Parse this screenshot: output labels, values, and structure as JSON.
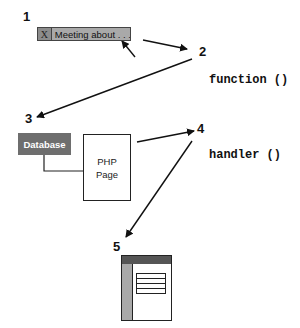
{
  "steps": [
    {
      "number": "1",
      "label": "step-1"
    },
    {
      "number": "2",
      "label": "step-2"
    },
    {
      "number": "3",
      "label": "step-3"
    },
    {
      "number": "4",
      "label": "step-4"
    },
    {
      "number": "5",
      "label": "step-5"
    }
  ],
  "tab": {
    "close_glyph": "X",
    "title": "Meeting about . . ."
  },
  "code_labels": {
    "function": "function ()",
    "handler": "handler ()"
  },
  "database": {
    "label": "Database"
  },
  "php_page": {
    "line1": "PHP",
    "line2": "Page"
  },
  "colors": {
    "tab_fill": "#a9a9a9",
    "database_fill": "#6e6e6e",
    "window_header": "#555555",
    "window_sidebar": "#a9a9a9",
    "stroke": "#222222"
  }
}
